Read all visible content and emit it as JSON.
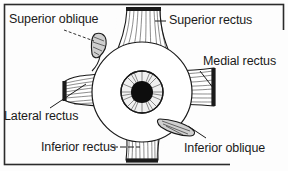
{
  "figure": {
    "frame_color": "#2b2b2b",
    "ink_color": "#1a1a1a",
    "background_color": "#fdfdfd",
    "labels": [
      {
        "id": "superior-oblique",
        "text": "Superior oblique",
        "position": "top-left",
        "leader": "dashed"
      },
      {
        "id": "superior-rectus",
        "text": "Superior rectus",
        "position": "top-right",
        "leader": "solid"
      },
      {
        "id": "medial-rectus",
        "text": "Medial rectus",
        "position": "right",
        "leader": "solid"
      },
      {
        "id": "lateral-rectus",
        "text": "Lateral rectus",
        "position": "bottom-left",
        "leader": "solid"
      },
      {
        "id": "inferior-rectus",
        "text": "Inferior rectus",
        "position": "bottom-center",
        "leader": "dashed"
      },
      {
        "id": "inferior-oblique",
        "text": "Inferior oblique",
        "position": "bottom-right",
        "leader": "solid"
      }
    ],
    "structures": [
      {
        "id": "eyeball",
        "name": "eyeball-globe"
      },
      {
        "id": "iris",
        "name": "iris"
      },
      {
        "id": "pupil",
        "name": "pupil"
      },
      {
        "id": "superior-rectus",
        "name": "superior-rectus-muscle"
      },
      {
        "id": "inferior-rectus",
        "name": "inferior-rectus-muscle"
      },
      {
        "id": "medial-rectus",
        "name": "medial-rectus-muscle"
      },
      {
        "id": "lateral-rectus",
        "name": "lateral-rectus-muscle"
      },
      {
        "id": "superior-oblique",
        "name": "superior-oblique-tendon"
      },
      {
        "id": "inferior-oblique",
        "name": "inferior-oblique-muscle"
      }
    ]
  }
}
